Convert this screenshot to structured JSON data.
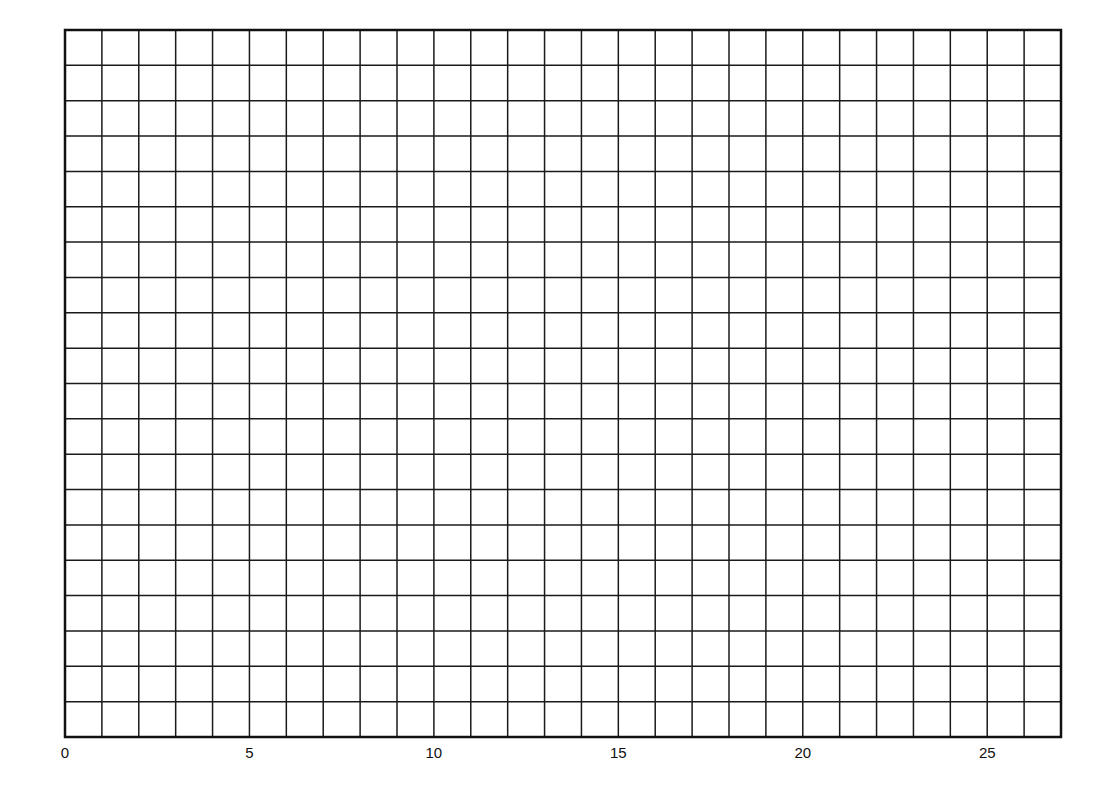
{
  "chart_data": {
    "type": "line",
    "title": "",
    "xlabel": "",
    "ylabel": "",
    "series": [],
    "x_ticks": [
      0,
      5,
      10,
      15,
      20,
      25
    ],
    "x_tick_labels": [
      "0",
      "5",
      "10",
      "15",
      "20",
      "25"
    ],
    "xlim": [
      0,
      27
    ],
    "y_ticks": [],
    "y_tick_labels": [],
    "grid": {
      "on": true,
      "columns": 27,
      "rows": 20
    },
    "legend": null
  },
  "style": {
    "line_color": "#1a1a1a",
    "border_color": "#111111",
    "background": "#ffffff"
  },
  "layout": {
    "plot_left": 65,
    "plot_top": 30,
    "plot_right": 1061,
    "plot_bottom": 737,
    "label_y": 758
  }
}
